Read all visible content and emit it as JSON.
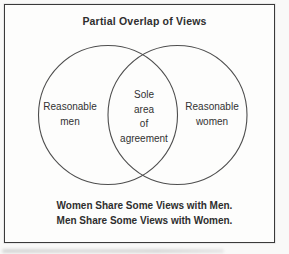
{
  "diagram": {
    "title": "Partial Overlap of Views",
    "venn": {
      "left_circle": {
        "lines": [
          "Reasonable",
          "men"
        ]
      },
      "overlap": {
        "lines": [
          "Sole",
          "area",
          "of",
          "agreement"
        ]
      },
      "right_circle": {
        "lines": [
          "Reasonable",
          "women"
        ]
      }
    },
    "caption": {
      "line1": "Women Share Some Views with Men.",
      "line2": "Men Share Some Views with Women."
    },
    "colors": {
      "ink": "#2e2e2e",
      "frame_border": "#3a3a3a",
      "circle_stroke": "#4e4e4e",
      "paper": "#fdfdfc"
    }
  }
}
